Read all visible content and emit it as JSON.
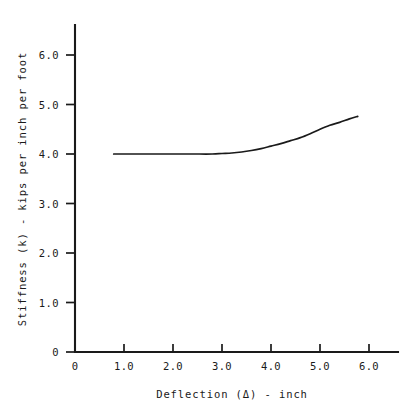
{
  "chart_data": {
    "type": "line",
    "title": "",
    "subtitle": "",
    "xlabel": "Deflection (Δ) - inch",
    "ylabel": "Stiffness (k) - kips per inch per foot",
    "xlim": [
      0,
      6.3
    ],
    "ylim": [
      0,
      6.55
    ],
    "grid": false,
    "legend": null,
    "xticks": [
      0,
      1.0,
      2.0,
      3.0,
      4.0,
      5.0,
      6.0
    ],
    "xtick_labels": [
      "0",
      "1.0",
      "2.0",
      "3.0",
      "4.0",
      "5.0",
      "6.0"
    ],
    "yticks": [
      0,
      1.0,
      2.0,
      3.0,
      4.0,
      5.0,
      6.0
    ],
    "ytick_labels": [
      "0",
      "1.0",
      "2.0",
      "3.0",
      "4.0",
      "5.0",
      "6.0"
    ],
    "series": [
      {
        "name": "stiffness-curve",
        "color": "#1a1a1a",
        "x": [
          0.79,
          1.2,
          1.6,
          2.0,
          2.4,
          2.8,
          3.0,
          3.2,
          3.4,
          3.6,
          3.8,
          4.0,
          4.2,
          4.4,
          4.6,
          4.8,
          5.0,
          5.2,
          5.4,
          5.6,
          5.77
        ],
        "y": [
          4.0,
          4.0,
          4.0,
          4.0,
          4.0,
          4.0,
          4.01,
          4.02,
          4.04,
          4.07,
          4.11,
          4.16,
          4.21,
          4.27,
          4.33,
          4.41,
          4.5,
          4.58,
          4.64,
          4.71,
          4.76
        ]
      }
    ],
    "annotations": []
  }
}
